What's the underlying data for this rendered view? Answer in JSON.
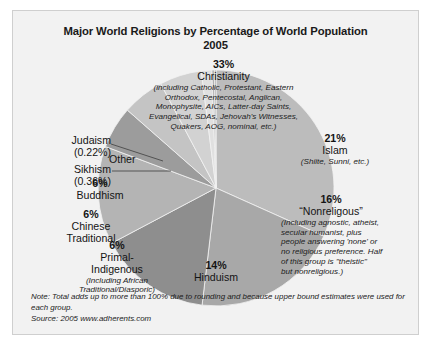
{
  "chart_data": {
    "type": "pie",
    "title": "Major World Religions by Percentage of World Population",
    "subtitle": "2005",
    "xlabel": "",
    "ylabel": "",
    "legend_position": "none",
    "grid": false,
    "categories": [
      "Christianity",
      "Islam",
      "“Nonreligous”",
      "Hinduism",
      "Primal-Indigenous",
      "Chinese Traditional",
      "Buddhism",
      "Other",
      "Sikhism",
      "Judaism"
    ],
    "values": [
      33,
      21,
      16,
      14,
      6,
      6,
      6,
      1.5,
      0.36,
      0.22
    ],
    "colors": [
      "#bcbcbc",
      "#a8a8a8",
      "#8e8e8e",
      "#b4b4b4",
      "#9c9c9c",
      "#c4c4c4",
      "#d2d2d2",
      "#e0e0e0",
      "#b0b0b0",
      "#9a9a9a"
    ],
    "slices": [
      {
        "label": "Christianity",
        "percent": "33%",
        "value": 33,
        "detail": "(including Catholic, Protestant, Eastern Orthodox, Pentecostal, Anglican, Monophysite, AICs, Latter-day Saints, Evangelical, SDAs, Jehovah's Witnesses, Quakers, AOG, nominal, etc.)"
      },
      {
        "label": "Islam",
        "percent": "21%",
        "value": 21,
        "detail": "(Shiite, Sunni, etc.)"
      },
      {
        "label": "“Nonreligous”",
        "percent": "16%",
        "value": 16,
        "detail": "(Including agnostic, atheist, secular humanist, plus people answering 'none' or no religious preference. Half of this group is \"theistic\" but nonreligious.)"
      },
      {
        "label": "Hinduism",
        "percent": "14%",
        "value": 14,
        "detail": ""
      },
      {
        "label": "Primal-Indigenous",
        "percent": "6%",
        "value": 6,
        "detail": "(Including African Traditional/Diasporic)"
      },
      {
        "label": "Chinese Traditional",
        "percent": "6%",
        "value": 6,
        "detail": ""
      },
      {
        "label": "Buddhism",
        "percent": "6%",
        "value": 6,
        "detail": ""
      },
      {
        "label": "Other",
        "percent": "",
        "value": 1.5,
        "detail": ""
      },
      {
        "label": "Sikhism",
        "percent": "(0.36%)",
        "value": 0.36,
        "detail": ""
      },
      {
        "label": "Judaism",
        "percent": "(0.22%)",
        "value": 0.22,
        "detail": ""
      }
    ],
    "note": "Note: Total adds up to more than 100% due to rounding and because upper bound estimates were used for each group.",
    "source": "Source: 2005 www.adherents.com"
  },
  "labels": {
    "christianity": {
      "pct": "33%",
      "name": "Christianity",
      "line1": "(including Catholic, Protestant, Eastern",
      "line2": "Orthodox, Pentecostal, Anglican,",
      "line3": "Monophysite, AICs, Latter-day Saints,",
      "line4": "Evangelical, SDAs, Jehovah's Witnesses,",
      "line5": "Quakers, AOG, nominal, etc.)"
    },
    "islam": {
      "pct": "21%",
      "name": "Islam",
      "line1": "(Shiite, Sunni, etc.)"
    },
    "nonreligious": {
      "pct": "16%",
      "name": "“Nonreligous”",
      "line1": "(Including agnostic, atheist,",
      "line2": "secular humanist, plus",
      "line3": "people answering 'none' or",
      "line4": "no religious preference. Half",
      "line5": "of this group is \"theistic\"",
      "line6": "but nonreligious.)"
    },
    "hinduism": {
      "pct": "14%",
      "name": "Hinduism"
    },
    "buddhism": {
      "pct": "6%",
      "name": "Buddhism"
    },
    "chinese": {
      "pct": "6%",
      "name1": "Chinese",
      "name2": "Traditional"
    },
    "primal": {
      "pct": "6%",
      "name1": "Primal-",
      "name2": "Indigenous",
      "line1": "(Including African",
      "line2": "Traditional/Diasporic)"
    },
    "judaism": {
      "name": "Judaism",
      "pct": "(0.22%)"
    },
    "sikhism": {
      "name": "Sikhism",
      "pct": "(0.36%)"
    },
    "other": {
      "name": "Other"
    }
  },
  "footer": {
    "note_line1": "Note: Total adds up to more than 100% due to rounding and because upper bound estimates were used for",
    "note_line2": "each group.",
    "source": "Source: 2005 www.adherents.com"
  }
}
